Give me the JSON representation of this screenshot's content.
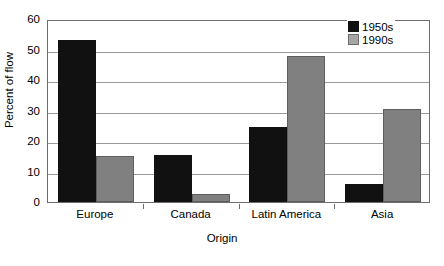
{
  "chart_data": {
    "type": "bar",
    "title": "",
    "subtitle": "",
    "xlabel": "Origin",
    "ylabel": "Percent of flow",
    "categories": [
      "Europe",
      "Canada",
      "Latin America",
      "Asia"
    ],
    "series": [
      {
        "name": "1950s",
        "color": "#111111",
        "values": [
          53,
          15.3,
          24.5,
          6
        ]
      },
      {
        "name": "1990s",
        "color": "#808080",
        "values": [
          15,
          2.5,
          48,
          30.5
        ]
      }
    ],
    "ylim": [
      0,
      60
    ],
    "ytick_step": 10,
    "yticks": [
      0,
      10,
      20,
      30,
      40,
      50,
      60
    ],
    "ytick_labels": [
      "0",
      "10",
      "20",
      "30",
      "40",
      "50",
      "60"
    ],
    "grid": true,
    "grid_axis": "y",
    "legend_position": "top-right",
    "legend_entries": [
      "1950s",
      "1990s"
    ],
    "background": "#ffffff",
    "frame_color": "#6d6d6d"
  }
}
